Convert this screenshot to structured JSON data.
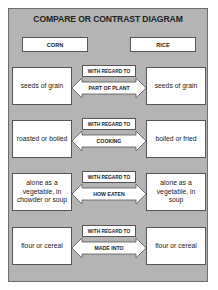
{
  "diagram": {
    "title": "COMPARE OR CONTRAST DIAGRAM",
    "left_header": "CORN",
    "right_header": "RICE",
    "connector_label": "WITH REGARD TO",
    "rows": [
      {
        "left": "seeds of grain",
        "criterion": "PART OF PLANT",
        "right": "seeds of grain"
      },
      {
        "left": "roasted or boiled",
        "criterion": "COOKING",
        "right": "boiled or fried"
      },
      {
        "left": "alone as a vegetable, in chowder or soup",
        "criterion": "HOW EATEN",
        "right": "alone as a vegetable, in soup"
      },
      {
        "left": "flour or cereal",
        "criterion": "MADE INTO",
        "right": "flour or cereal"
      }
    ],
    "colors": {
      "frame_bg": "#b4b4b4",
      "box_bg": "#ffffff",
      "border": "#555555"
    }
  }
}
